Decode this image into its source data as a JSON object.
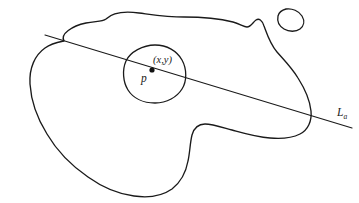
{
  "figure": {
    "kind": "hand-drawn-topology-diagram",
    "background_color": "#ffffff",
    "ink_color": "#1a1a1a",
    "width": 359,
    "height": 203,
    "labels": {
      "coords": "(x,y)",
      "point": "p",
      "line_base": "L",
      "line_subscript": "a"
    },
    "elements": {
      "region_name": "large-irregular-region",
      "neighborhood_name": "small-circular-neighborhood",
      "small_blob_name": "small-separate-blob",
      "line_name": "straight-line-L",
      "point_name": "marked-point-p"
    },
    "geometry": {
      "point_dot": {
        "cx": 152,
        "cy": 70,
        "r": 2.6
      },
      "line": {
        "x1": 45,
        "y1": 35,
        "x2": 352,
        "y2": 128
      },
      "region_path": "M 64 41 C 60 34 72 26 86 23 C 96 21 102 22 106 19 C 112 13 124 11 139 13 C 155 15 168 17 184 17 C 203 17 221 19 233 22 C 240 24 244 27 247 27 C 251 27 253 22 256 20 C 259 18 262 20 264 26 C 267 34 270 44 277 52 C 284 60 292 68 298 78 C 305 89 310 101 311 111 C 312 121 308 130 300 134 C 292 138 281 139 270 138 C 256 137 243 133 232 130 C 221 127 212 124 205 124 C 198 124 194 128 192 135 C 190 143 190 152 188 161 C 186 172 181 182 172 189 C 162 196 148 198 134 196 C 118 194 102 187 88 177 C 72 166 57 151 47 134 C 37 118 31 100 30 84 C 29 68 35 55 45 48 C 52 43 59 42 64 41 Z",
      "neighborhood_path": "M 155 45 C 167 45 177 51 182 60 C 187 69 187 81 182 89 C 177 97 167 103 155 103 C 143 103 133 98 128 90 C 123 82 122 70 126 61 C 130 52 143 45 155 45 Z",
      "small_blob_path": "M 286 9 C 292 8 299 11 302 16 C 305 21 304 26 300 29 C 296 32 289 32 284 29 C 279 26 277 21 278 16 C 279 12 282 10 286 9 Z"
    }
  }
}
